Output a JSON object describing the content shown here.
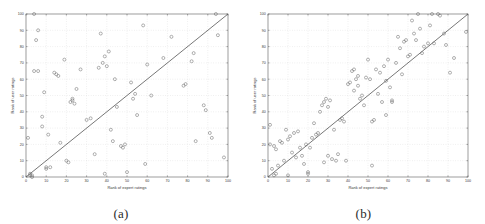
{
  "figure": {
    "background": "#ffffff",
    "panels": [
      {
        "id": "a",
        "caption": "(a)",
        "xlabel": "Rank of expert ratings",
        "ylabel": "Rank of user ratings"
      },
      {
        "id": "b",
        "caption": "(b)",
        "xlabel": "Rank of expert ratings",
        "ylabel": "Rank of user ratings"
      }
    ]
  },
  "style": {
    "marker_color": "#6f6f6f",
    "line_color": "#4a4a4a",
    "grid_color": "#cfcfcf",
    "axis_color": "#5a5a5a",
    "text_color": "#3a3a3a"
  },
  "chart_data": [
    {
      "type": "scatter",
      "panel": "a",
      "title": "",
      "xlabel": "Rank of expert ratings",
      "ylabel": "Rank of user ratings",
      "xlim": [
        0,
        100
      ],
      "ylim": [
        0,
        100
      ],
      "xticks": [
        0,
        10,
        20,
        30,
        40,
        50,
        60,
        70,
        80,
        90,
        100
      ],
      "yticks": [
        0,
        10,
        20,
        30,
        40,
        50,
        60,
        70,
        80,
        90,
        100
      ],
      "grid": true,
      "legend": "none",
      "reference_line": {
        "type": "identity",
        "from": [
          0,
          0
        ],
        "to": [
          100,
          100
        ]
      },
      "points": [
        [
          1,
          24
        ],
        [
          2,
          1
        ],
        [
          2,
          2
        ],
        [
          3,
          0
        ],
        [
          3,
          1
        ],
        [
          4,
          100
        ],
        [
          4,
          65
        ],
        [
          5,
          84
        ],
        [
          6,
          90
        ],
        [
          6,
          65
        ],
        [
          8,
          37
        ],
        [
          8,
          31
        ],
        [
          9,
          52
        ],
        [
          10,
          6
        ],
        [
          10,
          5
        ],
        [
          11,
          26
        ],
        [
          12,
          6
        ],
        [
          14,
          64
        ],
        [
          15,
          63
        ],
        [
          16,
          62
        ],
        [
          17,
          21
        ],
        [
          19,
          72
        ],
        [
          20,
          10
        ],
        [
          21,
          9
        ],
        [
          22,
          46
        ],
        [
          23,
          48
        ],
        [
          23,
          47
        ],
        [
          24,
          45
        ],
        [
          25,
          54
        ],
        [
          27,
          66
        ],
        [
          30,
          35
        ],
        [
          32,
          36
        ],
        [
          34,
          14
        ],
        [
          36,
          67
        ],
        [
          37,
          88
        ],
        [
          38,
          70
        ],
        [
          39,
          74
        ],
        [
          39,
          2
        ],
        [
          40,
          68
        ],
        [
          41,
          77
        ],
        [
          42,
          29
        ],
        [
          43,
          22
        ],
        [
          44,
          60
        ],
        [
          45,
          43
        ],
        [
          47,
          19
        ],
        [
          48,
          18
        ],
        [
          49,
          20
        ],
        [
          50,
          3
        ],
        [
          52,
          58
        ],
        [
          53,
          48
        ],
        [
          54,
          51
        ],
        [
          55,
          38
        ],
        [
          58,
          93
        ],
        [
          59,
          8
        ],
        [
          60,
          69
        ],
        [
          62,
          50
        ],
        [
          68,
          73
        ],
        [
          72,
          86
        ],
        [
          78,
          56
        ],
        [
          79,
          57
        ],
        [
          82,
          71
        ],
        [
          83,
          76
        ],
        [
          84,
          22
        ],
        [
          88,
          44
        ],
        [
          89,
          41
        ],
        [
          91,
          27
        ],
        [
          92,
          24
        ],
        [
          94,
          100
        ],
        [
          95,
          87
        ],
        [
          98,
          12
        ]
      ]
    },
    {
      "type": "scatter",
      "panel": "b",
      "title": "",
      "xlabel": "Rank of expert ratings",
      "ylabel": "Rank of user ratings",
      "xlim": [
        0,
        100
      ],
      "ylim": [
        0,
        100
      ],
      "xticks": [
        0,
        10,
        20,
        30,
        40,
        50,
        60,
        70,
        80,
        90,
        100
      ],
      "yticks": [
        0,
        10,
        20,
        30,
        40,
        50,
        60,
        70,
        80,
        90,
        100
      ],
      "grid": true,
      "legend": "none",
      "reference_line": {
        "type": "identity",
        "from": [
          0,
          0
        ],
        "to": [
          100,
          100
        ]
      },
      "points": [
        [
          1,
          32
        ],
        [
          1,
          20
        ],
        [
          2,
          5
        ],
        [
          3,
          1
        ],
        [
          3,
          19
        ],
        [
          4,
          2
        ],
        [
          4,
          17
        ],
        [
          5,
          7
        ],
        [
          6,
          22
        ],
        [
          7,
          21
        ],
        [
          8,
          10
        ],
        [
          9,
          29
        ],
        [
          10,
          23
        ],
        [
          10,
          1
        ],
        [
          11,
          25
        ],
        [
          12,
          15
        ],
        [
          13,
          27
        ],
        [
          14,
          12
        ],
        [
          15,
          28
        ],
        [
          16,
          18
        ],
        [
          17,
          13
        ],
        [
          18,
          8
        ],
        [
          19,
          20
        ],
        [
          20,
          2
        ],
        [
          20,
          3
        ],
        [
          21,
          18
        ],
        [
          22,
          24
        ],
        [
          23,
          33
        ],
        [
          24,
          26
        ],
        [
          25,
          27
        ],
        [
          26,
          40
        ],
        [
          27,
          44
        ],
        [
          28,
          46
        ],
        [
          28,
          9
        ],
        [
          29,
          48
        ],
        [
          30,
          43
        ],
        [
          30,
          13
        ],
        [
          31,
          47
        ],
        [
          32,
          11
        ],
        [
          33,
          29
        ],
        [
          34,
          10
        ],
        [
          35,
          14
        ],
        [
          36,
          35
        ],
        [
          37,
          36
        ],
        [
          38,
          34
        ],
        [
          39,
          10
        ],
        [
          40,
          57
        ],
        [
          41,
          58
        ],
        [
          42,
          65
        ],
        [
          43,
          66
        ],
        [
          43,
          53
        ],
        [
          44,
          60
        ],
        [
          45,
          62
        ],
        [
          45,
          56
        ],
        [
          46,
          48
        ],
        [
          47,
          50
        ],
        [
          48,
          44
        ],
        [
          49,
          61
        ],
        [
          50,
          72
        ],
        [
          51,
          60
        ],
        [
          52,
          34
        ],
        [
          52,
          7
        ],
        [
          53,
          35
        ],
        [
          54,
          66
        ],
        [
          55,
          51
        ],
        [
          56,
          64
        ],
        [
          57,
          46
        ],
        [
          58,
          68
        ],
        [
          59,
          59
        ],
        [
          59,
          38
        ],
        [
          60,
          72
        ],
        [
          61,
          55
        ],
        [
          62,
          47
        ],
        [
          62,
          46
        ],
        [
          64,
          70
        ],
        [
          65,
          86
        ],
        [
          66,
          79
        ],
        [
          67,
          63
        ],
        [
          68,
          83
        ],
        [
          69,
          84
        ],
        [
          70,
          74
        ],
        [
          71,
          75
        ],
        [
          72,
          96
        ],
        [
          73,
          88
        ],
        [
          74,
          84
        ],
        [
          75,
          100
        ],
        [
          76,
          91
        ],
        [
          77,
          76
        ],
        [
          78,
          80
        ],
        [
          80,
          82
        ],
        [
          81,
          93
        ],
        [
          82,
          100
        ],
        [
          83,
          82
        ],
        [
          85,
          100
        ],
        [
          86,
          99
        ],
        [
          88,
          88
        ],
        [
          89,
          81
        ],
        [
          91,
          64
        ],
        [
          93,
          73
        ],
        [
          99,
          89
        ]
      ]
    }
  ]
}
